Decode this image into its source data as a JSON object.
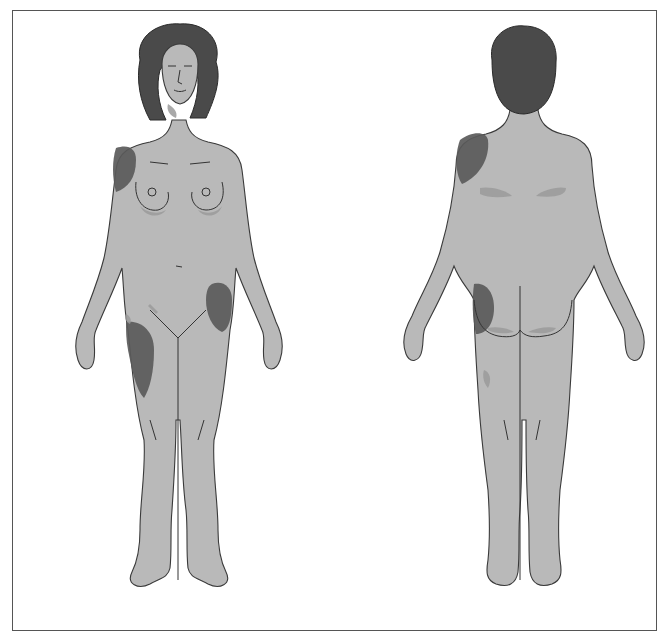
{
  "figure": {
    "views": [
      {
        "id": "front",
        "label": "Anterior view"
      },
      {
        "id": "back",
        "label": "Posterior view"
      }
    ],
    "colors": {
      "background": "#ffffff",
      "frame": "#555555",
      "skin": "#b9b9b9",
      "hair": "#4a4a4a",
      "lesion_dark": "#5a5a5a",
      "lesion_light": "#9a9a9a",
      "outline": "#3a3a3a"
    },
    "front_markings": [
      "right-shoulder",
      "left-hip",
      "right-thigh",
      "under-breasts",
      "groin",
      "neck"
    ],
    "back_markings": [
      "left-shoulder-blade",
      "lower-back-sides",
      "left-buttock",
      "buttock-folds",
      "left-posterior-thigh"
    ]
  }
}
